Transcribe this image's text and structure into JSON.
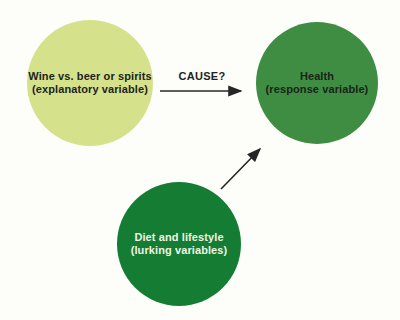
{
  "diagram": {
    "background_color": "#fdfdfa",
    "arrow_color": "#262626",
    "nodes": {
      "explanatory": {
        "line1": "Wine vs. beer or spirits",
        "line2": "(explanatory variable)",
        "fill": "#d6e18c",
        "text_color": "#20241a"
      },
      "response": {
        "line1": "Health",
        "line2": "(response variable)",
        "fill": "#3e8d43",
        "text_color": "#1b231a"
      },
      "lurking": {
        "line1": "Diet and lifestyle",
        "line2": "(lurking variables)",
        "fill": "#157c33",
        "text_color": "#eff4e3"
      }
    },
    "arrows": {
      "cause_label": "CAUSE?"
    }
  }
}
